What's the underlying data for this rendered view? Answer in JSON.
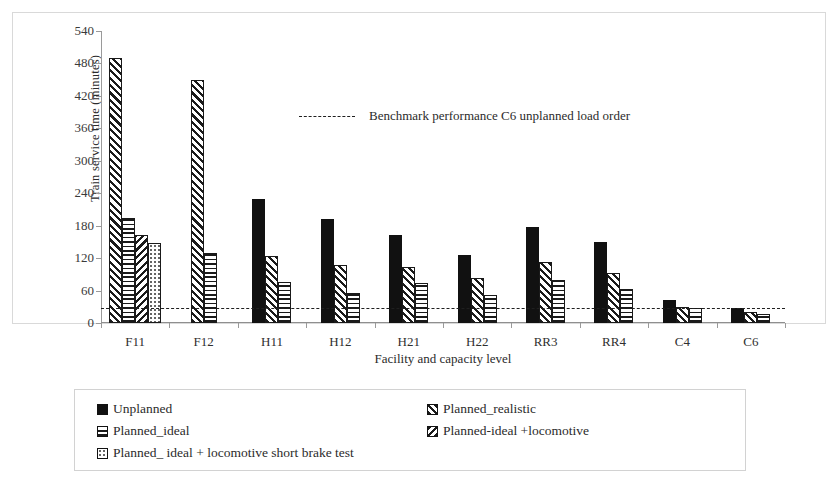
{
  "chart_data": {
    "type": "bar",
    "title": "",
    "xlabel": "Facility and capacity level",
    "ylabel": "Train service time (minutes)",
    "categories": [
      "F11",
      "F12",
      "H11",
      "H12",
      "H21",
      "H22",
      "RR3",
      "RR4",
      "C4",
      "C6"
    ],
    "ylim": [
      0,
      540
    ],
    "yticks": [
      0,
      60,
      120,
      180,
      240,
      300,
      360,
      420,
      480,
      540
    ],
    "grid": false,
    "legend_position": "bottom",
    "series": [
      {
        "name": "Unplanned",
        "pattern": "solid-black",
        "values": [
          null,
          null,
          230,
          193,
          163,
          126,
          178,
          150,
          42,
          27
        ]
      },
      {
        "name": "Planned_realistic",
        "pattern": "diagonal-hatch",
        "values": [
          490,
          450,
          124,
          107,
          103,
          83,
          112,
          93,
          30,
          20
        ]
      },
      {
        "name": "Planned_ideal",
        "pattern": "horizontal-hatch",
        "values": [
          195,
          130,
          76,
          55,
          74,
          51,
          80,
          63,
          27,
          17
        ]
      },
      {
        "name": "Planned-ideal +locomotive",
        "pattern": "back-diagonal-hatch",
        "values": [
          162,
          null,
          null,
          null,
          null,
          null,
          null,
          null,
          null,
          null
        ]
      },
      {
        "name": "Planned_ ideal + locomotive short brake test",
        "pattern": "dotted",
        "values": [
          148,
          null,
          null,
          null,
          null,
          null,
          null,
          null,
          null,
          null
        ]
      }
    ],
    "annotations": [
      {
        "name": "benchmark-line",
        "label": "Benchmark  performance C6 unplanned load order",
        "value": 28,
        "style": "dashed"
      }
    ]
  },
  "axes": {
    "y_title": "Train service time (minutes)",
    "x_title": "Facility and capacity level",
    "y_tick_labels": [
      "540",
      "480",
      "420",
      "360",
      "300",
      "240",
      "180",
      "120",
      "60",
      "0"
    ],
    "x_tick_labels": [
      "F11",
      "F12",
      "H11",
      "H12",
      "H21",
      "H22",
      "RR3",
      "RR4",
      "C4",
      "C6"
    ]
  },
  "benchmark": {
    "label": "Benchmark  performance C6 unplanned load order"
  },
  "legend": {
    "entries": [
      {
        "label": "Unplanned",
        "pattern": "solid-black"
      },
      {
        "label": "Planned_realistic",
        "pattern": "diagonal-hatch"
      },
      {
        "label": "Planned_ideal",
        "pattern": "horizontal-hatch"
      },
      {
        "label": "Planned-ideal +locomotive",
        "pattern": "back-diagonal-hatch"
      },
      {
        "label": "Planned_ ideal + locomotive short brake test",
        "pattern": "dotted"
      }
    ]
  },
  "colors": {
    "ink": "#1a1a1a",
    "frame": "#d9d9d9",
    "axis": "#9a9a9a",
    "background": "#ffffff"
  }
}
